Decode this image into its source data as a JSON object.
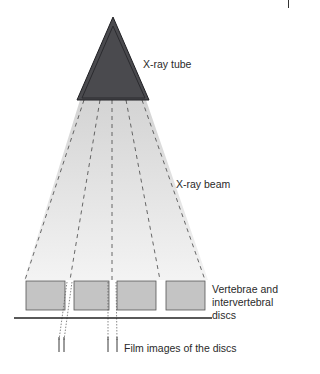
{
  "diagram": {
    "labels": {
      "tube": "X-ray tube",
      "beam": "X-ray beam",
      "vertebrae": "Vertebrae and intervertebral discs",
      "film": "Film images of the discs"
    },
    "colors": {
      "tube_fill": "#4a4a4e",
      "tube_stroke": "#1e1e22",
      "beam_fill": "#d6d6d6",
      "vertebra_fill": "#c4c4c4",
      "vertebra_stroke": "#555555",
      "film_line": "#222222",
      "dash_line": "#444444"
    },
    "vertebrae_count": 4
  }
}
